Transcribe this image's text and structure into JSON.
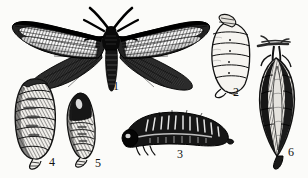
{
  "figure": {
    "background_color": "#fbfbf9",
    "ink_color": "#111111",
    "width": 308,
    "height": 178
  },
  "specimens": [
    {
      "id": "moth-adult",
      "label": "1",
      "name": "adult-moth-spread-wings",
      "label_x": 113,
      "label_y": 86
    },
    {
      "id": "pupa-upper-right",
      "label": "2",
      "name": "pupa-segmented-oval",
      "label_x": 233,
      "label_y": 90
    },
    {
      "id": "larva",
      "label": "3",
      "name": "larva-caterpillar-arched",
      "label_x": 177,
      "label_y": 152
    },
    {
      "id": "pupa-left-large",
      "label": "4",
      "name": "pupa-elongated-striped",
      "label_x": 49,
      "label_y": 160
    },
    {
      "id": "pupa-small",
      "label": "5",
      "name": "pupa-narrow-curved",
      "label_x": 95,
      "label_y": 161
    },
    {
      "id": "cocoon",
      "label": "6",
      "name": "cocoon-hanging-from-twig",
      "label_x": 288,
      "label_y": 150
    }
  ]
}
